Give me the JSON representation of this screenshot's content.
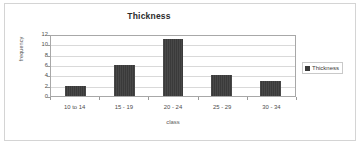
{
  "chart_data": {
    "type": "bar",
    "title": "Thickness",
    "xlabel": "class",
    "ylabel": "frequency",
    "categories": [
      "10 to 14",
      "15 - 19",
      "20 - 24",
      "25 - 29",
      "30 - 34"
    ],
    "values": [
      2,
      6,
      11,
      4,
      3
    ],
    "series": [
      {
        "name": "Thickness",
        "values": [
          2,
          6,
          11,
          4,
          3
        ]
      }
    ],
    "ylim": [
      0,
      12
    ],
    "yticks": [
      0,
      2,
      4,
      6,
      8,
      10,
      12
    ],
    "ytick_labels": [
      "0",
      "2",
      "4",
      "6",
      "8",
      "10",
      "12"
    ],
    "grid": true,
    "legend": {
      "position": "right",
      "entries": [
        "Thickness"
      ]
    },
    "colors": {
      "bar": "#3a3a3a",
      "plot_border": "#a8a8a8",
      "gridline": "#d9d9d9",
      "frame_border": "#d4d4d4",
      "background": "#ffffff",
      "title_text": "#2b2b2b",
      "axis_text": "#4d4d4d"
    }
  }
}
